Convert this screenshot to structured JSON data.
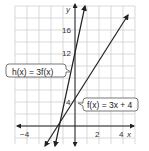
{
  "figure": {
    "axes": {
      "x_label": "x",
      "y_label": "y",
      "x_ticks": [
        {
          "value": -4,
          "label": "−4"
        },
        {
          "value": 2,
          "label": "2"
        },
        {
          "value": 4,
          "label": "4"
        }
      ],
      "y_ticks": [
        {
          "value": 4,
          "label": "4"
        },
        {
          "value": 12,
          "label": "12"
        },
        {
          "value": 16,
          "label": "16"
        }
      ],
      "x_range": [
        -5,
        5
      ],
      "y_range": [
        -3,
        20
      ],
      "grid_x_step": 1,
      "grid_y_step": 2
    },
    "lines": [
      {
        "name": "f",
        "label": "f(x) = 3x + 4",
        "slope": 3,
        "intercept": 4
      },
      {
        "name": "h",
        "label": "h(x) = 3f(x)",
        "slope": 9,
        "intercept": 12
      }
    ],
    "colors": {
      "grid": "#c8c8c8",
      "axis": "#222222",
      "line": "#222222",
      "callout_border": "#555555"
    }
  }
}
